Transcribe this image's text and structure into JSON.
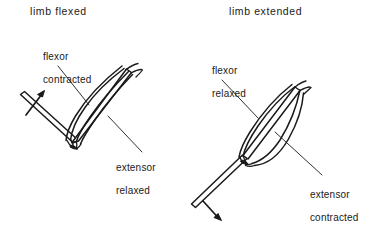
{
  "figure": {
    "background_color": "#ffffff",
    "ink_color": "#1a1a1a",
    "width": 392,
    "height": 229
  },
  "panels": [
    {
      "id": "limb-flexed",
      "title": "limb flexed",
      "labels": [
        {
          "id": "flexor-contracted",
          "line1": "flexor",
          "line2": "contracted",
          "muscle": "flexor",
          "state": "contracted"
        },
        {
          "id": "extensor-relaxed",
          "line1": "extensor",
          "line2": "relaxed",
          "muscle": "extensor",
          "state": "relaxed"
        }
      ],
      "motion_arrow": {
        "id": "flexion-arrow",
        "direction": "up-right",
        "meaning": "limb segment moves upward"
      }
    },
    {
      "id": "limb-extended",
      "title": "limb extended",
      "labels": [
        {
          "id": "flexor-relaxed",
          "line1": "flexor",
          "line2": "relaxed",
          "muscle": "flexor",
          "state": "relaxed"
        },
        {
          "id": "extensor-contracted",
          "line1": "extensor",
          "line2": "contracted",
          "muscle": "extensor",
          "state": "contracted"
        }
      ],
      "motion_arrow": {
        "id": "extension-arrow",
        "direction": "down-right",
        "meaning": "limb segment moves downward"
      }
    }
  ]
}
